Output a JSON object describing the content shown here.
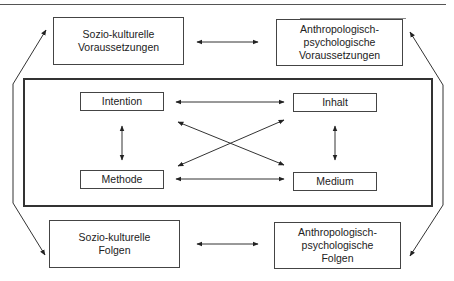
{
  "diagram": {
    "outer": {
      "top_left": "Sozio-kulturelle\nVoraussetzungen",
      "top_right": "Anthropologisch-\npsychologische\nVoraussetzungen",
      "bottom_left": "Sozio-kulturelle\nFolgen",
      "bottom_right": "Anthropologisch-\npsychologische\nFolgen"
    },
    "inner": {
      "intention": "Intention",
      "inhalt": "Inhalt",
      "methode": "Methode",
      "medium": "Medium"
    },
    "connections": [
      {
        "from": "Sozio-kulturelle Voraussetzungen",
        "to": "Anthropologisch-psychologische Voraussetzungen",
        "type": "bidirectional"
      },
      {
        "from": "Sozio-kulturelle Folgen",
        "to": "Anthropologisch-psychologische Folgen",
        "type": "bidirectional"
      },
      {
        "from": "Sozio-kulturelle Voraussetzungen",
        "to": "Sozio-kulturelle Folgen",
        "type": "bidirectional"
      },
      {
        "from": "Anthropologisch-psychologische Voraussetzungen",
        "to": "Anthropologisch-psychologische Folgen",
        "type": "bidirectional"
      },
      {
        "from": "Intention",
        "to": "Inhalt",
        "type": "bidirectional"
      },
      {
        "from": "Methode",
        "to": "Medium",
        "type": "bidirectional"
      },
      {
        "from": "Intention",
        "to": "Methode",
        "type": "bidirectional"
      },
      {
        "from": "Inhalt",
        "to": "Medium",
        "type": "bidirectional"
      },
      {
        "from": "Intention",
        "to": "Medium",
        "type": "bidirectional"
      },
      {
        "from": "Inhalt",
        "to": "Methode",
        "type": "bidirectional"
      }
    ]
  }
}
